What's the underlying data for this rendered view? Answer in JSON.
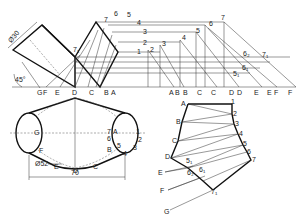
{
  "drawing": {
    "title": "Development of transition piece (oblique cylinder to cylinder)",
    "dimensions": {
      "diameter_top": "Ø30",
      "angle": "45°",
      "diameter_bottom": "Ø52",
      "width": "70"
    },
    "elevation_baseline_labels": [
      "G",
      "F",
      "E",
      "D",
      "C",
      "B",
      "A"
    ],
    "true_length_baseline_labels": [
      "A",
      "B",
      "B",
      "C",
      "C",
      "D",
      "D",
      "E",
      "E",
      "F",
      "F"
    ],
    "elevation_generator_labels": [
      "7",
      "6",
      "5",
      "4",
      "3",
      "2",
      "1",
      "7₁"
    ],
    "true_length_top_labels": [
      "2",
      "3",
      "4",
      "5",
      "6",
      "7",
      "5₁",
      "6₁",
      "6₂",
      "7₁"
    ],
    "plan_labels": [
      "G",
      "F",
      "E",
      "D",
      "C",
      "B",
      "A",
      "1",
      "2",
      "3",
      "4",
      "5",
      "6",
      "7"
    ],
    "development_left_labels": [
      "A",
      "B",
      "C",
      "D",
      "E",
      "F",
      "G"
    ],
    "development_right_labels": [
      "1",
      "2",
      "3",
      "4",
      "5",
      "6",
      "7"
    ],
    "development_inner_labels": [
      "5₁",
      "6₂",
      "6₁",
      "7₁"
    ]
  }
}
